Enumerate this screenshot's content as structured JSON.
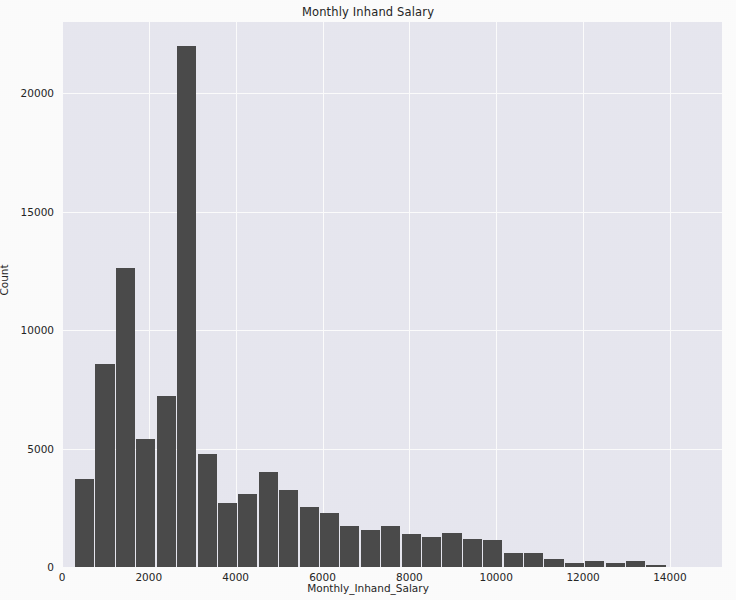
{
  "chart_data": {
    "type": "bar",
    "title": "Monthly Inhand Salary",
    "xlabel": "Monthly_Inhand_Salary",
    "ylabel": "Count",
    "xlim": [
      0,
      15200
    ],
    "ylim": [
      0,
      23000
    ],
    "xticks": [
      0,
      2000,
      4000,
      6000,
      8000,
      10000,
      12000,
      14000
    ],
    "xticklabels": [
      "0",
      "2000",
      "4000",
      "6000",
      "8000",
      "10000",
      "12000",
      "14000"
    ],
    "yticks": [
      0,
      5000,
      10000,
      15000,
      20000
    ],
    "yticklabels": [
      "0",
      "5000",
      "10000",
      "15000",
      "20000"
    ],
    "grid": true,
    "legend": null,
    "bar_color": "#4c4c4c",
    "plot_background": "#eaeaf2",
    "figure_background": "#ffffff",
    "bin_width": 470,
    "bin_left_edges": [
      300,
      770,
      1240,
      1710,
      2180,
      2650,
      3120,
      3590,
      4060,
      4530,
      5000,
      5470,
      5940,
      6410,
      6880,
      7350,
      7820,
      8290,
      8760,
      9230,
      9700,
      10170,
      10640,
      11110,
      11580,
      12050,
      12520,
      12990,
      13460,
      13930,
      14400,
      14870
    ],
    "values": [
      3700,
      8550,
      12600,
      5400,
      7200,
      22000,
      4750,
      2700,
      3100,
      4000,
      3250,
      2550,
      2300,
      1750,
      1550,
      1750,
      1400,
      1250,
      1450,
      1200,
      1150,
      600,
      600,
      350,
      150,
      250,
      150,
      250,
      100,
      0,
      0,
      0
    ]
  },
  "axis": {
    "title": "Monthly Inhand Salary",
    "ylabel": "Count",
    "xlabel": "Monthly_Inhand_Salary"
  }
}
